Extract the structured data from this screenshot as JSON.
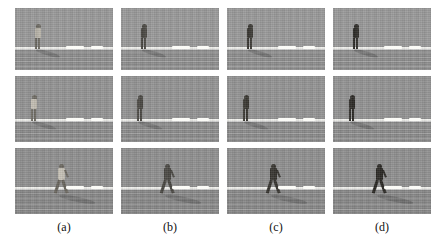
{
  "figure": {
    "type": "image-grid",
    "columns": 4,
    "rows": 3,
    "background": "#ffffff",
    "panel_background": "#8f8f8f"
  },
  "captions": [
    {
      "label": "(a)"
    },
    {
      "label": "(b)"
    },
    {
      "label": "(c)"
    },
    {
      "label": "(d)"
    }
  ],
  "panels": [
    {
      "id": "r1c1",
      "row": 1,
      "col": 1,
      "caption": "(a)",
      "scene": "standing-person-far",
      "person_pose": "standing",
      "person_tone": "#6d6a62",
      "person_shirt_tone": "#b9b5aa",
      "sky_tone": "#9a9a9a",
      "ground_tone": "#8d8d8d",
      "shadow_opacity": 0.5,
      "person_x_pct": 18,
      "contrast": "low"
    },
    {
      "id": "r1c2",
      "row": 1,
      "col": 2,
      "caption": "(b)",
      "scene": "standing-person-far",
      "person_pose": "standing",
      "person_tone": "#4a4843",
      "person_shirt_tone": "#4a4843",
      "sky_tone": "#9a9a9a",
      "ground_tone": "#8d8d8d",
      "shadow_opacity": 0.52,
      "person_x_pct": 18,
      "contrast": "medium"
    },
    {
      "id": "r1c3",
      "row": 1,
      "col": 3,
      "caption": "(c)",
      "scene": "standing-person-far",
      "person_pose": "standing",
      "person_tone": "#3a3833",
      "person_shirt_tone": "#3a3833",
      "sky_tone": "#9a9a9a",
      "ground_tone": "#8d8d8d",
      "shadow_opacity": 0.55,
      "person_x_pct": 18,
      "contrast": "high"
    },
    {
      "id": "r1c4",
      "row": 1,
      "col": 4,
      "caption": "(d)",
      "scene": "standing-person-far",
      "person_pose": "standing",
      "person_tone": "#2e2c28",
      "person_shirt_tone": "#2e2c28",
      "sky_tone": "#9a9a9a",
      "ground_tone": "#8d8d8d",
      "shadow_opacity": 0.58,
      "person_x_pct": 18,
      "contrast": "highest"
    },
    {
      "id": "r2c1",
      "row": 2,
      "col": 1,
      "caption": "(a)",
      "scene": "standing-person-mid",
      "person_pose": "standing",
      "person_tone": "#6f6c64",
      "person_shirt_tone": "#c2bdb2",
      "sky_tone": "#949494",
      "ground_tone": "#8a8a8a",
      "shadow_opacity": 0.5,
      "person_x_pct": 14,
      "contrast": "low"
    },
    {
      "id": "r2c2",
      "row": 2,
      "col": 2,
      "caption": "(b)",
      "scene": "standing-person-mid",
      "person_pose": "standing",
      "person_tone": "#4b4944",
      "person_shirt_tone": "#4b4944",
      "sky_tone": "#949494",
      "ground_tone": "#8a8a8a",
      "shadow_opacity": 0.52,
      "person_x_pct": 14,
      "contrast": "medium"
    },
    {
      "id": "r2c3",
      "row": 2,
      "col": 3,
      "caption": "(c)",
      "scene": "standing-person-mid",
      "person_pose": "standing",
      "person_tone": "#393731",
      "person_shirt_tone": "#393731",
      "sky_tone": "#949494",
      "ground_tone": "#8a8a8a",
      "shadow_opacity": 0.55,
      "person_x_pct": 14,
      "contrast": "high"
    },
    {
      "id": "r2c4",
      "row": 2,
      "col": 4,
      "caption": "(d)",
      "scene": "standing-person-mid",
      "person_pose": "standing",
      "person_tone": "#2d2b27",
      "person_shirt_tone": "#2d2b27",
      "sky_tone": "#949494",
      "ground_tone": "#8a8a8a",
      "shadow_opacity": 0.58,
      "person_x_pct": 14,
      "contrast": "highest"
    },
    {
      "id": "r3c1",
      "row": 3,
      "col": 1,
      "caption": "(a)",
      "scene": "walking-person-near",
      "person_pose": "walking",
      "person_tone": "#6b675f",
      "person_shirt_tone": "#c6c1b6",
      "sky_tone": "#909090",
      "ground_tone": "#878787",
      "shadow_opacity": 0.5,
      "person_x_pct": 42,
      "contrast": "low"
    },
    {
      "id": "r3c2",
      "row": 3,
      "col": 2,
      "caption": "(b)",
      "scene": "walking-person-near",
      "person_pose": "walking",
      "person_tone": "#4a4843",
      "person_shirt_tone": "#4a4843",
      "sky_tone": "#909090",
      "ground_tone": "#878787",
      "shadow_opacity": 0.52,
      "person_x_pct": 42,
      "contrast": "medium"
    },
    {
      "id": "r3c3",
      "row": 3,
      "col": 3,
      "caption": "(c)",
      "scene": "walking-person-near",
      "person_pose": "walking",
      "person_tone": "#373530",
      "person_shirt_tone": "#373530",
      "sky_tone": "#909090",
      "ground_tone": "#878787",
      "shadow_opacity": 0.55,
      "person_x_pct": 42,
      "contrast": "high"
    },
    {
      "id": "r3c4",
      "row": 3,
      "col": 4,
      "caption": "(d)",
      "scene": "walking-person-near",
      "person_pose": "walking",
      "person_tone": "#2b2925",
      "person_shirt_tone": "#2b2925",
      "sky_tone": "#909090",
      "ground_tone": "#878787",
      "shadow_opacity": 0.58,
      "person_x_pct": 42,
      "contrast": "highest"
    }
  ]
}
